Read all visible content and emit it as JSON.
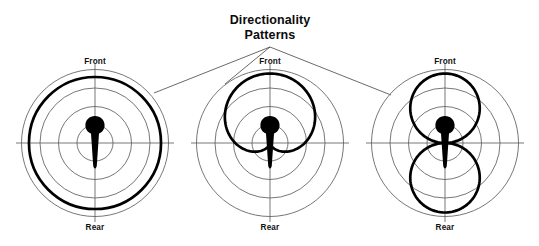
{
  "figure": {
    "title_line1": "Directionality",
    "title_line2": "Patterns",
    "background_color": "#ffffff",
    "grid_color": "#5f5f5f",
    "pattern_color": "#000000",
    "text_color": "#0b0b0b"
  },
  "labels": {
    "front": "Front",
    "rear": "Rear"
  },
  "diagrams": [
    {
      "id": "omnidirectional",
      "pattern_name": "Omnidirectional",
      "front_label": "Front",
      "rear_label": "Rear",
      "center": {
        "x": 95,
        "y": 143
      },
      "grid_radii": [
        18,
        36.5,
        55,
        73.5
      ],
      "axis_extent": 79
    },
    {
      "id": "cardioid",
      "pattern_name": "Cardioid",
      "front_label": "Front",
      "rear_label": "Rear",
      "center": {
        "x": 270,
        "y": 143
      },
      "grid_radii": [
        18,
        36.5,
        55,
        73.5
      ],
      "axis_extent": 79
    },
    {
      "id": "bidirectional",
      "pattern_name": "Bidirectional",
      "front_label": "Front",
      "rear_label": "Rear",
      "center": {
        "x": 445,
        "y": 143
      },
      "grid_radii": [
        18,
        36.5,
        55,
        73.5
      ],
      "axis_extent": 79
    }
  ],
  "leader_lines": {
    "origin": {
      "x": 270,
      "y": 47
    },
    "targets": [
      {
        "x": 154,
        "y": 93
      },
      {
        "x": 225,
        "y": 84
      },
      {
        "x": 391,
        "y": 95
      }
    ]
  },
  "chart_data": {
    "type": "line",
    "title": "Directionality Patterns",
    "subtitle": "",
    "xlabel": "",
    "ylabel": "",
    "coordinate_system": "polar",
    "angle_reference": "0 deg = Front (up), 180 deg = Rear (down)",
    "radial_axis": {
      "gridlines_normalized": [
        0.25,
        0.5,
        0.75,
        1.0
      ],
      "grid": true,
      "rlim": [
        0,
        1
      ]
    },
    "angular_axis": {
      "tick_labels": [
        "Front",
        "Rear"
      ],
      "tick_angles_deg": [
        0,
        180
      ],
      "crosshair_axes_deg": [
        0,
        90,
        180,
        270
      ]
    },
    "legend": {
      "show": false,
      "position": "none"
    },
    "annotations": [
      {
        "text": "Directionality",
        "x": 270,
        "y": 22
      },
      {
        "text": "Patterns",
        "x": 270,
        "y": 37
      }
    ],
    "series": [
      {
        "name": "Omnidirectional",
        "panel": 1,
        "formula": "r(theta) = 1.0",
        "normalized_radius_at_front": 0.95,
        "normalized_radius_at_rear": 0.95,
        "samples_deg": [
          0,
          30,
          60,
          90,
          120,
          150,
          180,
          210,
          240,
          270,
          300,
          330
        ],
        "samples_r": [
          0.95,
          0.95,
          0.95,
          0.95,
          0.95,
          0.95,
          0.95,
          0.95,
          0.95,
          0.95,
          0.95,
          0.95
        ]
      },
      {
        "name": "Cardioid",
        "panel": 2,
        "formula": "r(theta) = 0.5 * (1 + cos(theta))",
        "normalized_radius_at_front": 1.0,
        "normalized_radius_at_rear": 0.0,
        "samples_deg": [
          0,
          30,
          60,
          90,
          120,
          150,
          180,
          210,
          240,
          270,
          300,
          330
        ],
        "samples_r": [
          1.0,
          0.93,
          0.75,
          0.5,
          0.25,
          0.07,
          0.0,
          0.07,
          0.25,
          0.5,
          0.75,
          0.93
        ]
      },
      {
        "name": "Bidirectional",
        "panel": 3,
        "formula": "r(theta) = |cos(theta)|",
        "normalized_radius_at_front": 1.0,
        "normalized_radius_at_rear": 1.0,
        "samples_deg": [
          0,
          30,
          60,
          90,
          120,
          150,
          180,
          210,
          240,
          270,
          300,
          330
        ],
        "samples_r": [
          1.0,
          0.87,
          0.5,
          0.0,
          0.5,
          0.87,
          1.0,
          0.87,
          0.5,
          0.0,
          0.5,
          0.87
        ]
      }
    ]
  }
}
